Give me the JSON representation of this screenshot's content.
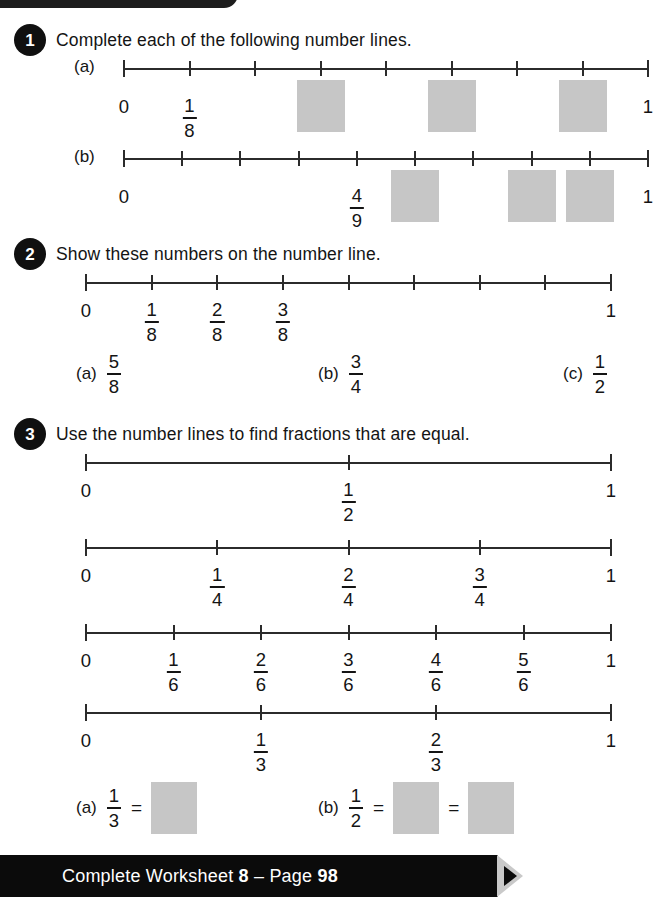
{
  "page": {
    "footer_prefix": "Complete Worksheet ",
    "footer_worksheet": "8",
    "footer_sep": " – Page ",
    "footer_page": "98",
    "footer_full": "Complete Worksheet 8 – Page 98"
  },
  "questions": [
    {
      "number": "1",
      "title": "Complete each of the following number lines.",
      "parts": [
        {
          "label": "(a)",
          "denominator": 8,
          "ticks": 9,
          "labels": [
            {
              "index": 0,
              "type": "plain",
              "text": "0"
            },
            {
              "index": 1,
              "type": "fraction",
              "num": "1",
              "den": "8"
            },
            {
              "index": 8,
              "type": "plain",
              "text": "1"
            }
          ],
          "answer_boxes": [
            {
              "index": 3
            },
            {
              "index": 5
            },
            {
              "index": 7
            }
          ]
        },
        {
          "label": "(b)",
          "denominator": 9,
          "ticks": 10,
          "labels": [
            {
              "index": 0,
              "type": "plain",
              "text": "0"
            },
            {
              "index": 4,
              "type": "fraction",
              "num": "4",
              "den": "9"
            },
            {
              "index": 9,
              "type": "plain",
              "text": "1"
            }
          ],
          "answer_boxes": [
            {
              "index": 5
            },
            {
              "index": 7
            },
            {
              "index": 8
            }
          ]
        }
      ]
    },
    {
      "number": "2",
      "title": "Show these numbers on the number line.",
      "line": {
        "denominator": 8,
        "ticks": 9,
        "labels": [
          {
            "index": 0,
            "type": "plain",
            "text": "0"
          },
          {
            "index": 1,
            "type": "fraction",
            "num": "1",
            "den": "8"
          },
          {
            "index": 2,
            "type": "fraction",
            "num": "2",
            "den": "8"
          },
          {
            "index": 3,
            "type": "fraction",
            "num": "3",
            "den": "8"
          },
          {
            "index": 8,
            "type": "plain",
            "text": "1"
          }
        ]
      },
      "subparts": [
        {
          "label": "(a)",
          "num": "5",
          "den": "8"
        },
        {
          "label": "(b)",
          "num": "3",
          "den": "4"
        },
        {
          "label": "(c)",
          "num": "1",
          "den": "2"
        }
      ]
    },
    {
      "number": "3",
      "title": "Use the number lines to find fractions that are equal.",
      "lines": [
        {
          "denominator": 2,
          "ticks": 3,
          "labels": [
            {
              "index": 0,
              "type": "plain",
              "text": "0"
            },
            {
              "index": 1,
              "type": "fraction",
              "num": "1",
              "den": "2"
            },
            {
              "index": 2,
              "type": "plain",
              "text": "1"
            }
          ]
        },
        {
          "denominator": 4,
          "ticks": 5,
          "labels": [
            {
              "index": 0,
              "type": "plain",
              "text": "0"
            },
            {
              "index": 1,
              "type": "fraction",
              "num": "1",
              "den": "4"
            },
            {
              "index": 2,
              "type": "fraction",
              "num": "2",
              "den": "4"
            },
            {
              "index": 3,
              "type": "fraction",
              "num": "3",
              "den": "4"
            },
            {
              "index": 4,
              "type": "plain",
              "text": "1"
            }
          ]
        },
        {
          "denominator": 6,
          "ticks": 7,
          "labels": [
            {
              "index": 0,
              "type": "plain",
              "text": "0"
            },
            {
              "index": 1,
              "type": "fraction",
              "num": "1",
              "den": "6"
            },
            {
              "index": 2,
              "type": "fraction",
              "num": "2",
              "den": "6"
            },
            {
              "index": 3,
              "type": "fraction",
              "num": "3",
              "den": "6"
            },
            {
              "index": 4,
              "type": "fraction",
              "num": "4",
              "den": "6"
            },
            {
              "index": 5,
              "type": "fraction",
              "num": "5",
              "den": "6"
            },
            {
              "index": 6,
              "type": "plain",
              "text": "1"
            }
          ]
        },
        {
          "denominator": 3,
          "ticks": 4,
          "labels": [
            {
              "index": 0,
              "type": "plain",
              "text": "0"
            },
            {
              "index": 1,
              "type": "fraction",
              "num": "1",
              "den": "3"
            },
            {
              "index": 2,
              "type": "fraction",
              "num": "2",
              "den": "3"
            },
            {
              "index": 3,
              "type": "plain",
              "text": "1"
            }
          ]
        }
      ],
      "answers": [
        {
          "label": "(a)",
          "num": "1",
          "den": "3",
          "equals": "=",
          "boxes": 1
        },
        {
          "label": "(b)",
          "num": "1",
          "den": "2",
          "equals": "=",
          "boxes": 2
        }
      ]
    }
  ]
}
